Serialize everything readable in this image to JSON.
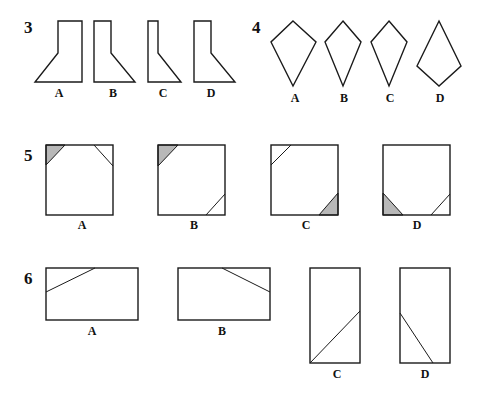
{
  "questions": [
    {
      "number": "3",
      "options": [
        "A",
        "B",
        "C",
        "D"
      ],
      "description": "L-shaped figures: rectangle on top of a sloped trapezoid base"
    },
    {
      "number": "4",
      "options": [
        "A",
        "B",
        "C",
        "D"
      ],
      "description": "Kite shapes in various proportions"
    },
    {
      "number": "5",
      "options": [
        "A",
        "B",
        "C",
        "D"
      ],
      "description": "Squares with corner triangles cut, one shaded grey"
    },
    {
      "number": "6",
      "options": [
        "A",
        "B",
        "C",
        "D"
      ],
      "description": "Rectangles with a single diagonal line segment"
    }
  ],
  "colors": {
    "stroke": "#1a1a1a",
    "shade": "#b8b8b8",
    "background": "#ffffff"
  }
}
